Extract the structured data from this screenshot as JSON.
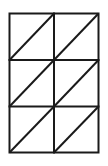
{
  "diagram": {
    "columns": 2,
    "rows": 3,
    "stroke_color": "#1a1a1a",
    "background_color": "#ffffff",
    "grid": {
      "x_lines": [
        9.5,
        54,
        98.5
      ],
      "y_lines": [
        13.5,
        60,
        106.5,
        152.5
      ]
    }
  }
}
